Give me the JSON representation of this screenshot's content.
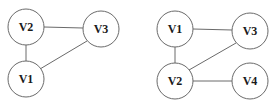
{
  "graphs": [
    {
      "name": "graph-left",
      "nodes": [
        {
          "id": "V2",
          "label": "V2",
          "cx": 26,
          "cy": 27,
          "r": 18
        },
        {
          "id": "V3",
          "label": "V3",
          "cx": 101,
          "cy": 29,
          "r": 18
        },
        {
          "id": "V1",
          "label": "V1",
          "cx": 26,
          "cy": 79,
          "r": 18
        }
      ],
      "edges": [
        {
          "from": "V2",
          "to": "V3"
        },
        {
          "from": "V2",
          "to": "V1"
        },
        {
          "from": "V1",
          "to": "V3"
        }
      ]
    },
    {
      "name": "graph-right",
      "nodes": [
        {
          "id": "V1",
          "label": "V1",
          "cx": 175,
          "cy": 29,
          "r": 18
        },
        {
          "id": "V3",
          "label": "V3",
          "cx": 250,
          "cy": 31,
          "r": 18
        },
        {
          "id": "V2",
          "label": "V2",
          "cx": 175,
          "cy": 81,
          "r": 18
        },
        {
          "id": "V4",
          "label": "V4",
          "cx": 250,
          "cy": 81,
          "r": 18
        }
      ],
      "edges": [
        {
          "from": "V1",
          "to": "V3"
        },
        {
          "from": "V1",
          "to": "V2"
        },
        {
          "from": "V2",
          "to": "V3"
        },
        {
          "from": "V2",
          "to": "V4"
        }
      ]
    }
  ],
  "colors": {
    "stroke": "#6a6a6a",
    "label": "#1a1a1a",
    "background": "#ffffff"
  }
}
